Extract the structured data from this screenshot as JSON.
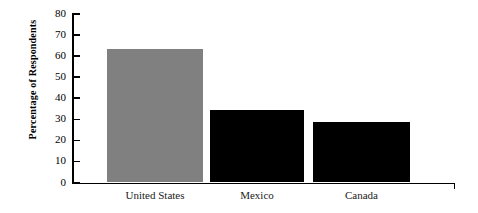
{
  "chart_data": {
    "type": "bar",
    "title": "",
    "subtitle": "",
    "xlabel": "",
    "ylabel": "Percentage of Respondents",
    "categories": [
      "United States",
      "Mexico",
      "Canada"
    ],
    "values": [
      63.5,
      34.5,
      28.5
    ],
    "bar_colors": [
      "#808080",
      "#000000",
      "#000000"
    ],
    "ylim": [
      0,
      80
    ],
    "y_ticks": [
      0,
      10,
      20,
      30,
      40,
      50,
      60,
      70,
      80
    ],
    "y_tick_labels": [
      "0",
      "10",
      "20",
      "30",
      "40",
      "50",
      "60",
      "70",
      "80"
    ],
    "grid": false,
    "legend": false,
    "legend_position": "none",
    "axis_color": "#000000",
    "background_color": "#ffffff"
  }
}
